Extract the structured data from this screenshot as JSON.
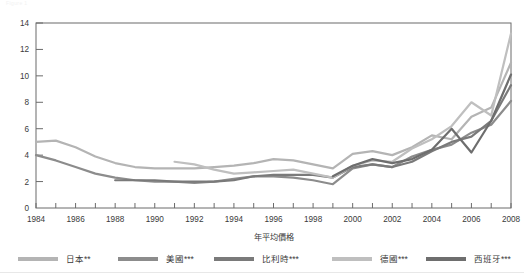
{
  "header": {
    "faint_text": "Figure 1"
  },
  "chart_data": {
    "type": "line",
    "title": "",
    "xlabel": "年平均價格",
    "ylabel": "",
    "xlim": [
      1984,
      2008
    ],
    "ylim": [
      0,
      14
    ],
    "yticks": [
      0,
      2,
      4,
      6,
      8,
      10,
      12,
      14
    ],
    "xticks": [
      1984,
      1986,
      1988,
      1990,
      1992,
      1994,
      1996,
      1998,
      2000,
      2002,
      2004,
      2006,
      2008
    ],
    "x_minor_step": 1,
    "grid": false,
    "legend_position": "bottom",
    "x": [
      1984,
      1985,
      1986,
      1987,
      1988,
      1989,
      1990,
      1991,
      1992,
      1993,
      1994,
      1995,
      1996,
      1997,
      1998,
      1999,
      2000,
      2001,
      2002,
      2003,
      2004,
      2005,
      2006,
      2007,
      2008
    ],
    "series": [
      {
        "name": "日本**",
        "color": "#b4b4b4",
        "x": [
          1984,
          1985,
          1986,
          1987,
          1988,
          1989,
          1990,
          1991,
          1992,
          1993,
          1994,
          1995,
          1996,
          1997,
          1998,
          1999,
          2000,
          2001,
          2002,
          2003,
          2004,
          2005,
          2006,
          2007,
          2008
        ],
        "values": [
          5.0,
          5.1,
          4.6,
          3.9,
          3.4,
          3.1,
          3.0,
          3.0,
          3.0,
          3.1,
          3.2,
          3.4,
          3.7,
          3.6,
          3.3,
          3.0,
          4.1,
          4.3,
          4.0,
          4.6,
          5.5,
          5.2,
          6.9,
          7.6,
          11.0
        ]
      },
      {
        "name": "美國***",
        "color": "#8c8c8c",
        "x": [
          1984,
          1985,
          1986,
          1987,
          1988,
          1989,
          1990,
          1991,
          1992,
          1993,
          1994,
          1995,
          1996,
          1997,
          1998,
          1999,
          2000,
          2001,
          2002,
          2003,
          2004,
          2005,
          2006,
          2007,
          2008
        ],
        "values": [
          4.0,
          3.6,
          3.1,
          2.6,
          2.3,
          2.1,
          2.0,
          2.0,
          1.9,
          2.0,
          2.2,
          2.4,
          2.4,
          2.3,
          2.1,
          1.8,
          3.0,
          3.3,
          3.1,
          3.9,
          4.4,
          4.8,
          5.7,
          6.3,
          8.1
        ]
      },
      {
        "name": "比利時***",
        "color": "#7a7a7a",
        "x": [
          1988,
          1989,
          1990,
          1991,
          1992,
          1993,
          1994,
          1995,
          1996,
          1997,
          1998,
          1999,
          2000,
          2001,
          2002,
          2003,
          2004,
          2005,
          2006,
          2007,
          2008
        ],
        "values": [
          2.1,
          2.1,
          2.1,
          2.0,
          2.0,
          2.0,
          2.1,
          2.4,
          2.5,
          2.5,
          2.5,
          2.3,
          3.1,
          3.3,
          3.1,
          3.5,
          4.3,
          5.0,
          5.4,
          6.6,
          9.3
        ]
      },
      {
        "name": "德國***",
        "color": "#bfbfbf",
        "x": [
          1991,
          1992,
          1993,
          1994,
          1995,
          1996,
          1997,
          1998,
          1999,
          2000,
          2001,
          2002,
          2003,
          2004,
          2005,
          2006,
          2007,
          2008
        ],
        "values": [
          3.5,
          3.3,
          2.9,
          2.6,
          2.7,
          2.8,
          2.9,
          2.6,
          2.3,
          3.2,
          3.6,
          3.5,
          4.5,
          5.2,
          6.2,
          8.0,
          7.0,
          13.2
        ]
      },
      {
        "name": "西班牙***",
        "color": "#6e6e6e",
        "x": [
          1999,
          2000,
          2001,
          2002,
          2003,
          2004,
          2005,
          2006,
          2007,
          2008
        ],
        "values": [
          2.4,
          3.2,
          3.7,
          3.4,
          3.7,
          4.4,
          6.0,
          4.2,
          6.6,
          10.1
        ]
      }
    ]
  },
  "legend": [
    {
      "label": "日本**",
      "color": "#b4b4b4"
    },
    {
      "label": "美國***",
      "color": "#8c8c8c"
    },
    {
      "label": "比利時***",
      "color": "#7a7a7a"
    },
    {
      "label": "德國***",
      "color": "#bfbfbf"
    },
    {
      "label": "西班牙***",
      "color": "#6e6e6e"
    }
  ],
  "axes": {
    "x_title": "年平均價格"
  }
}
